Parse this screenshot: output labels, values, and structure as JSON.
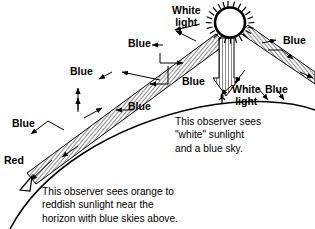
{
  "figure": {
    "background_color": "#ffffff",
    "ink_color": "#000000",
    "beam_fill": "#9a9a9a"
  },
  "sun": {
    "name": "sun",
    "center_x": 228,
    "center_y": 22,
    "radius": 15,
    "spike_count": 40,
    "fill": "#ffffff",
    "outline": "#000000"
  },
  "labels": {
    "white_light_top": "White\nlight",
    "white_light_top_line1": "White",
    "white_light_top_line2": "light",
    "white_light_observer_line1": "White",
    "white_light_observer_line2": "light",
    "blue_1": "Blue",
    "blue_2": "Blue",
    "blue_3": "Blue",
    "blue_4": "Blue",
    "blue_5": "Blue",
    "blue_6": "Blue",
    "blue_7": "Blue",
    "red": "Red"
  },
  "annotations": {
    "upper_observer": {
      "line1": "This observer sees",
      "line2": "\"white\" sunlight",
      "line3": "and a blue sky."
    },
    "lower_observer": {
      "line1": "This observer sees orange to",
      "line2": "reddish sunlight near the",
      "line3": "horizon with blue skies above."
    }
  },
  "beams": [
    {
      "name": "slant-beam-to-horizon-observer",
      "from": "sun",
      "to": "horizon-observer"
    },
    {
      "name": "vertical-beam-to-overhead-observer",
      "from": "sun",
      "to": "overhead-observer"
    },
    {
      "name": "right-beam",
      "from": "sun",
      "to": "right-edge"
    }
  ],
  "observers": [
    {
      "name": "overhead-observer",
      "x": 222,
      "y": 100
    },
    {
      "name": "horizon-observer",
      "x": 24,
      "y": 186
    }
  ]
}
